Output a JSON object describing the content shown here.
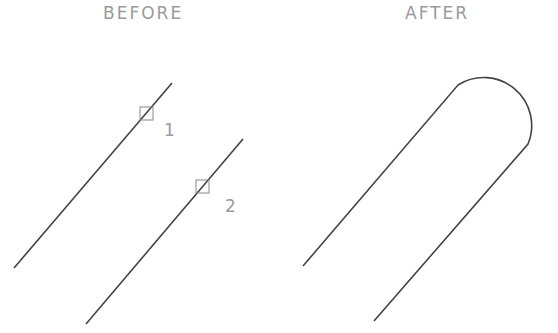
{
  "diagram": {
    "before": {
      "title": "BEFORE",
      "lines": [
        {
          "id": 1,
          "label": "1",
          "x1": 14,
          "y1": 268,
          "x2": 172,
          "y2": 83,
          "pick_box": {
            "x": 140,
            "y": 107,
            "size": 13
          }
        },
        {
          "id": 2,
          "label": "2",
          "x1": 86,
          "y1": 324,
          "x2": 243,
          "y2": 139,
          "pick_box": {
            "x": 196,
            "y": 180,
            "size": 13
          }
        }
      ]
    },
    "after": {
      "title": "AFTER",
      "shape": "two parallel lines joined by semicircular fillet arc",
      "path": "M303,266 L458,85 A48,48 0 0 1 528,144 L374,321"
    },
    "colors": {
      "line": "#444444",
      "pick_box": "#888888",
      "text": "#9a9a9a"
    }
  }
}
